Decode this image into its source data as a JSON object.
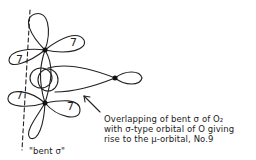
{
  "diagram": {
    "type": "orbital-overlap-sketch",
    "lobe_labels": [
      "7",
      "7",
      "7",
      "7"
    ],
    "annotation": {
      "line1": "Overlapping of bent σ of O₂",
      "line2": "with σ-type orbital of O giving",
      "line3": "rise to the μ-orbital, No.9"
    },
    "bent_sigma_label": "\"bent σ\"",
    "colors": {
      "ink": "#222222",
      "background": "#ffffff"
    }
  }
}
